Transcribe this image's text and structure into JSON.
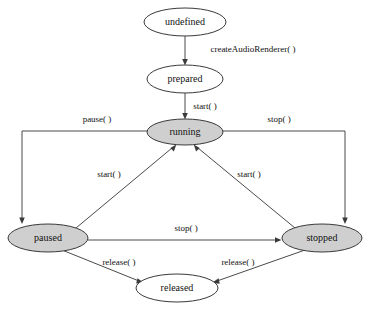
{
  "diagram": {
    "type": "state-machine",
    "caption": "",
    "colors": {
      "node_fill_active": "#cfcfcf",
      "node_fill_inactive": "#ffffff",
      "node_stroke": "#3a3a3a",
      "edge_stroke": "#4a4a4a",
      "text": "#111111",
      "background": "#ffffff"
    },
    "nodes": [
      {
        "id": "undefined",
        "label": "undefined",
        "fill": "white",
        "cx": 185,
        "cy": 22,
        "rx": 41,
        "ry": 14
      },
      {
        "id": "prepared",
        "label": "prepared",
        "fill": "white",
        "cx": 185,
        "cy": 79,
        "rx": 38,
        "ry": 14
      },
      {
        "id": "running",
        "label": "running",
        "fill": "gray",
        "cx": 185,
        "cy": 132,
        "rx": 38,
        "ry": 13
      },
      {
        "id": "paused",
        "label": "paused",
        "fill": "gray",
        "cx": 48,
        "cy": 238,
        "rx": 40,
        "ry": 14
      },
      {
        "id": "stopped",
        "label": "stopped",
        "fill": "gray",
        "cx": 322,
        "cy": 238,
        "rx": 40,
        "ry": 14
      },
      {
        "id": "released",
        "label": "released",
        "fill": "white",
        "cx": 177,
        "cy": 288,
        "rx": 41,
        "ry": 14
      }
    ],
    "edges": [
      {
        "id": "undefined-to-prepared",
        "from": "undefined",
        "to": "prepared",
        "label": "createAudioRenderer( )",
        "label_x": 253,
        "label_y": 52
      },
      {
        "id": "prepared-to-running",
        "from": "prepared",
        "to": "running",
        "label": "start( )",
        "label_x": 205,
        "label_y": 109
      },
      {
        "id": "running-to-paused",
        "from": "running",
        "to": "paused",
        "label": "pause( )",
        "label_x": 97,
        "label_y": 122
      },
      {
        "id": "running-to-stopped",
        "from": "running",
        "to": "stopped",
        "label": "stop( )",
        "label_x": 279,
        "label_y": 122
      },
      {
        "id": "paused-to-running",
        "from": "paused",
        "to": "running",
        "label": "start( )",
        "label_x": 109,
        "label_y": 177
      },
      {
        "id": "stopped-to-running",
        "from": "stopped",
        "to": "running",
        "label": "start( )",
        "label_x": 249,
        "label_y": 177
      },
      {
        "id": "paused-to-stopped",
        "from": "paused",
        "to": "stopped",
        "label": "stop( )",
        "label_x": 186,
        "label_y": 231
      },
      {
        "id": "paused-to-released",
        "from": "paused",
        "to": "released",
        "label": "release( )",
        "label_x": 119,
        "label_y": 265
      },
      {
        "id": "stopped-to-released",
        "from": "stopped",
        "to": "released",
        "label": "release( )",
        "label_x": 238,
        "label_y": 265
      }
    ]
  }
}
